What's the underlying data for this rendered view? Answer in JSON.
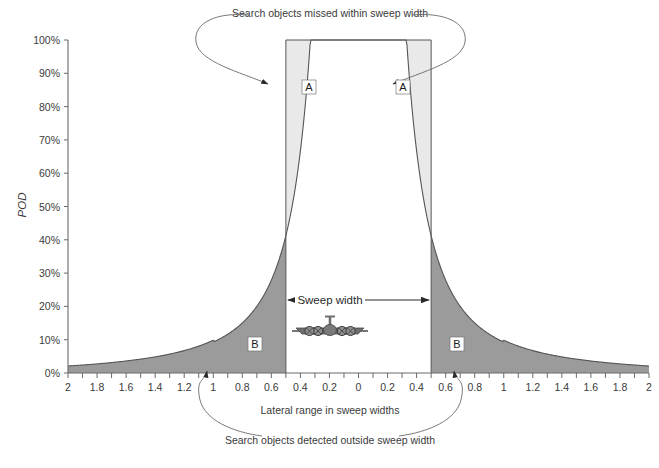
{
  "figure": {
    "width": 659,
    "height": 468,
    "background": "#ffffff"
  },
  "axes": {
    "y_label": "POD",
    "x_label": "Lateral range in sweep widths",
    "y_ticks": [
      "0%",
      "10%",
      "20%",
      "30%",
      "40%",
      "50%",
      "60%",
      "70%",
      "80%",
      "90%",
      "100%"
    ],
    "y_values": [
      0,
      10,
      20,
      30,
      40,
      50,
      60,
      70,
      80,
      90,
      100
    ],
    "x_ticks": [
      "2",
      "1.8",
      "1.6",
      "1.4",
      "1.2",
      "1",
      "0.8",
      "0.6",
      "0.4",
      "0.2",
      "0",
      "0.2",
      "0.4",
      "0.6",
      "0.8",
      "1",
      "1.2",
      "1.4",
      "1.6",
      "1.8",
      "2"
    ],
    "x_values": [
      -2,
      -1.8,
      -1.6,
      -1.4,
      -1.2,
      -1,
      -0.8,
      -0.6,
      -0.4,
      -0.2,
      0,
      0.2,
      0.4,
      0.6,
      0.8,
      1,
      1.2,
      1.4,
      1.6,
      1.8,
      2
    ]
  },
  "annotations": {
    "top": "Search objects missed within sweep width",
    "bottom": "Search objects detected outside sweep width",
    "sweep_width": "Sweep width",
    "region_a_left": "A",
    "region_a_right": "A",
    "region_b_left": "B",
    "region_b_right": "B"
  },
  "colors": {
    "region_a_fill": "#e9e9e9",
    "region_b_fill": "#9b9b9b",
    "curve_stroke": "#555555",
    "axis_stroke": "#6a6a6a",
    "rect_stroke": "#555555",
    "annotation_stroke": "#6a6a6a",
    "text": "#3a3a3a",
    "aircraft_fill": "#6e6e6e"
  },
  "chart_data": {
    "type": "area",
    "title": "",
    "subtitle": "",
    "xlabel": "Lateral range in sweep widths",
    "ylabel": "POD",
    "xlim": [
      -2,
      2
    ],
    "ylim": [
      0,
      100
    ],
    "grid": false,
    "legend": null,
    "sweep_width_half": 0.5,
    "series": [
      {
        "name": "Lateral range curve (POD)",
        "x": [
          -2,
          -1.9,
          -1.8,
          -1.7,
          -1.6,
          -1.5,
          -1.4,
          -1.3,
          -1.2,
          -1.1,
          -1,
          -0.9,
          -0.8,
          -0.7,
          -0.6,
          -0.55,
          -0.5,
          -0.45,
          -0.4,
          -0.35,
          -0.3,
          -0.25,
          -0.2,
          -0.15,
          -0.1,
          -0.05,
          0,
          0.05,
          0.1,
          0.15,
          0.2,
          0.25,
          0.3,
          0.35,
          0.4,
          0.45,
          0.5,
          0.55,
          0.6,
          0.7,
          0.8,
          0.9,
          1,
          1.1,
          1.2,
          1.3,
          1.4,
          1.5,
          1.6,
          1.7,
          1.8,
          1.9,
          2
        ],
        "values": [
          2,
          2.2,
          2.5,
          2.8,
          3.2,
          3.7,
          4.3,
          5.1,
          6.1,
          7.5,
          9.3,
          11.8,
          15.1,
          19.4,
          25,
          26.5,
          28.5,
          34,
          42,
          53,
          65,
          77,
          87,
          93.5,
          97.5,
          99.5,
          100,
          99.5,
          97.5,
          93.5,
          87,
          77,
          65,
          53,
          42,
          34,
          28.5,
          26.5,
          25,
          19.4,
          15.1,
          11.8,
          9.3,
          7.5,
          6.1,
          5.1,
          4.3,
          3.7,
          3.2,
          2.8,
          2.5,
          2.2,
          2
        ]
      }
    ],
    "regions": [
      {
        "label": "A",
        "description": "Search objects missed within sweep width",
        "fill": "#e9e9e9",
        "x_range": [
          -0.5,
          0.5
        ],
        "bounded_above_by": 100,
        "bounded_below_by": "curve"
      },
      {
        "label": "B",
        "description": "Search objects detected outside sweep width",
        "fill": "#9b9b9b",
        "x_range_left": [
          -2,
          -0.5
        ],
        "x_range_right": [
          0.5,
          2
        ],
        "bounded_above_by": "curve",
        "bounded_below_by": 0
      }
    ]
  }
}
